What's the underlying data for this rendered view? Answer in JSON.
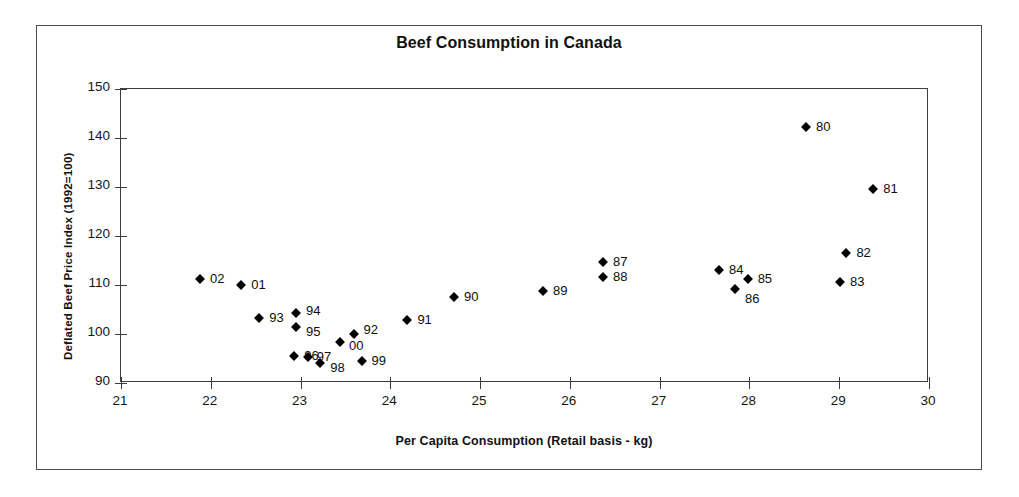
{
  "chart_data": {
    "type": "scatter",
    "title": "Beef Consumption in Canada",
    "xlabel": "Per Capita Consumption (Retail basis - kg)",
    "ylabel": "Deflated Beef Price Index (1992=100)",
    "xlim": [
      21,
      30
    ],
    "ylim": [
      90,
      150
    ],
    "xticks": [
      "21",
      "22",
      "23",
      "24",
      "25",
      "26",
      "27",
      "28",
      "29",
      "30"
    ],
    "yticks": [
      "90",
      "100",
      "110",
      "120",
      "130",
      "140",
      "150"
    ],
    "grid": false,
    "legend": "none",
    "marker": "filled-diamond",
    "marker_color": "#000000",
    "points": [
      {
        "label": "80",
        "x": 28.63,
        "y": 142.3,
        "lx": 10,
        "ly": -1
      },
      {
        "label": "81",
        "x": 29.38,
        "y": 129.5,
        "lx": 10,
        "ly": -1
      },
      {
        "label": "82",
        "x": 29.08,
        "y": 116.5,
        "lx": 10,
        "ly": -1
      },
      {
        "label": "83",
        "x": 29.01,
        "y": 110.6,
        "lx": 10,
        "ly": -1
      },
      {
        "label": "84",
        "x": 27.66,
        "y": 113.0,
        "lx": 10,
        "ly": -1
      },
      {
        "label": "85",
        "x": 27.98,
        "y": 111.3,
        "lx": 10,
        "ly": -1
      },
      {
        "label": "86",
        "x": 27.84,
        "y": 109.1,
        "lx": 10,
        "ly": 9
      },
      {
        "label": "87",
        "x": 26.37,
        "y": 114.6,
        "lx": 10,
        "ly": -1
      },
      {
        "label": "88",
        "x": 26.37,
        "y": 111.6,
        "lx": 10,
        "ly": -1
      },
      {
        "label": "89",
        "x": 25.7,
        "y": 108.8,
        "lx": 10,
        "ly": -1
      },
      {
        "label": "90",
        "x": 24.71,
        "y": 107.6,
        "lx": 10,
        "ly": -1
      },
      {
        "label": "91",
        "x": 24.19,
        "y": 102.9,
        "lx": 10,
        "ly": -1
      },
      {
        "label": "92",
        "x": 23.59,
        "y": 100.0,
        "lx": 10,
        "ly": -5
      },
      {
        "label": "93",
        "x": 22.54,
        "y": 103.2,
        "lx": 10,
        "ly": -1
      },
      {
        "label": "94",
        "x": 22.95,
        "y": 104.2,
        "lx": 10,
        "ly": -3
      },
      {
        "label": "95",
        "x": 22.95,
        "y": 101.5,
        "lx": 10,
        "ly": 4
      },
      {
        "label": "96",
        "x": 22.93,
        "y": 95.5,
        "lx": 10,
        "ly": -1
      },
      {
        "label": "97",
        "x": 23.08,
        "y": 95.3,
        "lx": 9,
        "ly": -1
      },
      {
        "label": "98",
        "x": 23.22,
        "y": 94.1,
        "lx": 10,
        "ly": 4
      },
      {
        "label": "99",
        "x": 23.68,
        "y": 94.5,
        "lx": 10,
        "ly": -1
      },
      {
        "label": "00",
        "x": 23.44,
        "y": 98.3,
        "lx": 9,
        "ly": 3
      },
      {
        "label": "01",
        "x": 22.34,
        "y": 110.1,
        "lx": 10,
        "ly": -1
      },
      {
        "label": "02",
        "x": 21.88,
        "y": 111.3,
        "lx": 10,
        "ly": -1
      }
    ]
  },
  "colors": {
    "frame": "#4a4a4a",
    "axis": "#3d3d3d",
    "text": "#111111",
    "marker": "#000000",
    "background": "#ffffff"
  }
}
